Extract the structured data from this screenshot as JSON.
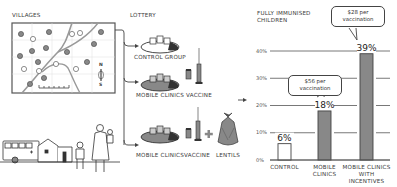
{
  "sections": {
    "villages": "VILLAGES",
    "lottery": "LOTTERY",
    "chart_title_line1": "FULLY IMMUNISED",
    "chart_title_line2": "CHILDREN"
  },
  "map": {
    "compass_north": "N",
    "compass_south": "S"
  },
  "groups": [
    {
      "label": "CONTROL GROUP",
      "items": []
    },
    {
      "label": "MOBILE CLINICS",
      "items": [
        "VACCINE"
      ]
    },
    {
      "label": "MOBILE CLINICS",
      "items": [
        "VACCINE",
        "LENTILS"
      ],
      "plus": "+"
    }
  ],
  "colors": {
    "bar_fill": "#888888",
    "control_fill": "#ffffff",
    "outline": "#444444",
    "grid": "#555555"
  },
  "chart_data": {
    "type": "bar",
    "categories": [
      "CONTROL",
      "MOBILE CLINICS",
      "MOBILE CLINICS WITH INCENTIVES"
    ],
    "category_lines": [
      [
        "CONTROL"
      ],
      [
        "MOBILE",
        "CLINICS"
      ],
      [
        "MOBILE CLINICS",
        "WITH",
        "INCENTIVES"
      ]
    ],
    "values": [
      6,
      18,
      39
    ],
    "value_labels": [
      "6%",
      "18%",
      "39%"
    ],
    "ylim": [
      0,
      40
    ],
    "yticks": [
      0,
      10,
      20,
      30,
      40
    ],
    "ytick_labels": [
      "0%",
      "10%",
      "20%",
      "30%",
      "40%"
    ],
    "grid": true,
    "annotations": [
      {
        "target": "MOBILE CLINICS",
        "line1": "$56 per",
        "line2": "vaccination"
      },
      {
        "target": "MOBILE CLINICS WITH INCENTIVES",
        "line1": "$28 per",
        "line2": "vaccination"
      }
    ]
  }
}
